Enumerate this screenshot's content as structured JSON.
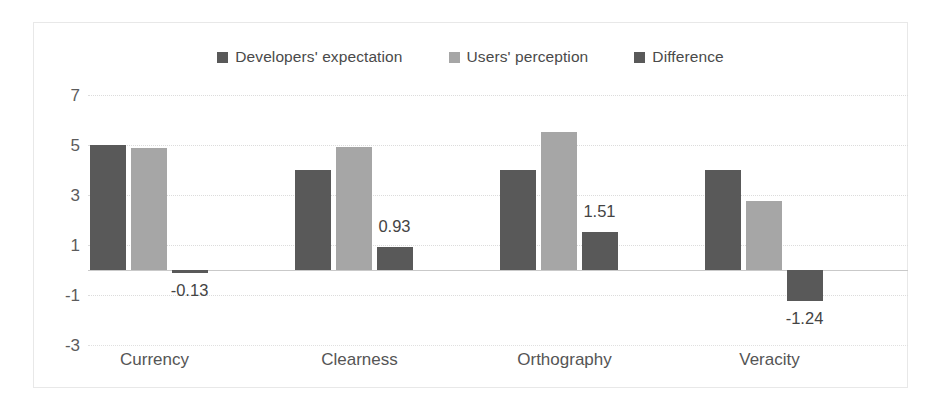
{
  "chart_data": {
    "type": "bar",
    "title": "",
    "subtitle": "",
    "xlabel": "",
    "ylabel": "",
    "categories": [
      "Currency",
      "Clearness",
      "Orthography",
      "Veracity"
    ],
    "series": [
      {
        "name": "Developers' expectation",
        "color": "#595959",
        "values": [
          5.0,
          4.0,
          4.0,
          4.0
        ]
      },
      {
        "name": "Users' perception",
        "color": "#a6a6a6",
        "values": [
          4.87,
          4.93,
          5.51,
          2.76
        ]
      },
      {
        "name": "Difference",
        "color": "#595959",
        "values": [
          -0.13,
          0.93,
          1.51,
          -1.24
        ]
      }
    ],
    "data_labels": {
      "series": "Difference",
      "values": [
        "-0.13",
        "0.93",
        "1.51",
        "-1.24"
      ]
    },
    "yticks": [
      7,
      5,
      3,
      1,
      -1,
      -3
    ],
    "ytick_labels": [
      "7",
      "5",
      "3",
      "1",
      "-1",
      "-3"
    ],
    "ylim": [
      -3,
      7
    ],
    "grid": true,
    "legend_position": "top"
  },
  "legend": {
    "items": [
      {
        "label": "Developers' expectation",
        "color": "#595959",
        "icon": "legend-swatch-icon"
      },
      {
        "label": "Users' perception",
        "color": "#a6a6a6",
        "icon": "legend-swatch-icon"
      },
      {
        "label": "Difference",
        "color": "#595959",
        "icon": "legend-swatch-icon"
      }
    ]
  },
  "axes": {
    "y_tick_labels": [
      "7",
      "5",
      "3",
      "1",
      "-1",
      "-3"
    ],
    "x_tick_labels": [
      "Currency",
      "Clearness",
      "Orthography",
      "Veracity"
    ]
  },
  "labels": {
    "currency_difference": "-0.13",
    "clearness_difference": "0.93",
    "orthography_difference": "1.51",
    "veracity_difference": "-1.24"
  },
  "colors": {
    "series_dark": "#595959",
    "series_light": "#a6a6a6",
    "gridline": "#dcdcdc",
    "zero_line": "#c9c9c9",
    "frame": "#e8e8e8",
    "text": "#555555",
    "background": "#ffffff"
  }
}
